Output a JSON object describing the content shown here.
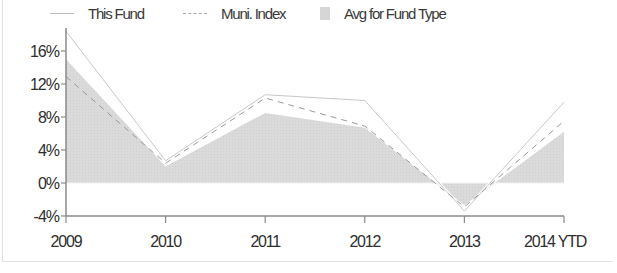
{
  "legend": {
    "this_fund": "This Fund",
    "muni_index": "Muni. Index",
    "avg_fund_type": "Avg for Fund Type"
  },
  "colors": {
    "this_fund": "#c8c8c8",
    "muni_index": "#9a9a9a",
    "avg_fund_type": "#d9d9d9",
    "axis": "#8a8a8a",
    "text": "#2e2e2e"
  },
  "chart_data": {
    "type": "line",
    "title": "",
    "xlabel": "",
    "ylabel": "",
    "categories": [
      "2009",
      "2010",
      "2011",
      "2012",
      "2013",
      "2014 YTD"
    ],
    "series": [
      {
        "name": "This Fund",
        "style": "solid line",
        "values": [
          18.4,
          2.7,
          10.7,
          10.0,
          -3.4,
          9.8
        ]
      },
      {
        "name": "Muni. Index",
        "style": "dashed line",
        "values": [
          12.9,
          2.4,
          10.3,
          6.9,
          -2.9,
          7.5
        ]
      },
      {
        "name": "Avg for Fund Type",
        "style": "filled area",
        "values": [
          15.0,
          2.0,
          8.5,
          6.7,
          -2.7,
          6.2
        ]
      }
    ],
    "yticks": [
      "16%",
      "12%",
      "8%",
      "4%",
      "0%",
      "-4%"
    ],
    "ytick_values": [
      16,
      12,
      8,
      4,
      0,
      -4
    ],
    "ylim": [
      -4,
      19
    ],
    "grid": false,
    "legend_position": "top"
  }
}
